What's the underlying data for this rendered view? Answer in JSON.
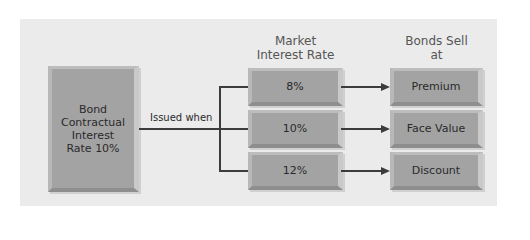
{
  "diagram": {
    "source": {
      "label": "Bond Contractual Interest Rate 10%",
      "lines": [
        "Bond",
        "Contractual",
        "Interest",
        "Rate 10%"
      ]
    },
    "connector_label": "Issued when",
    "columns": {
      "market_header": [
        "Market",
        "Interest Rate"
      ],
      "sell_header": [
        "Bonds Sell",
        "at"
      ]
    },
    "rows": [
      {
        "market_rate": "8%",
        "sells_at": "Premium"
      },
      {
        "market_rate": "10%",
        "sells_at": "Face Value"
      },
      {
        "market_rate": "12%",
        "sells_at": "Discount"
      }
    ]
  },
  "colors": {
    "panel": "#ebebeb",
    "box": "#a3a3a3",
    "line": "#3c3c3c"
  }
}
